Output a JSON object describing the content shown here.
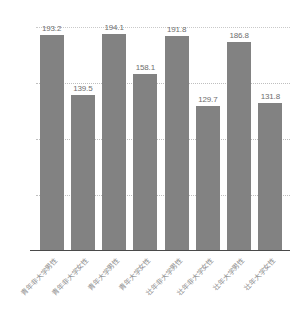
{
  "chart_data": {
    "type": "bar",
    "title": "",
    "xlabel": "",
    "ylabel": "",
    "ylim": [
      0,
      200
    ],
    "yticks": [
      "0.0",
      "50.0",
      "100.0",
      "150.0",
      "200.0"
    ],
    "ytick_values": [
      0,
      50,
      100,
      150,
      200
    ],
    "grid": true,
    "legend": "none",
    "bar_color": "#828282",
    "categories": [
      "青年非大学男性",
      "青年非大学女性",
      "青年大学男性",
      "青年大学女性",
      "壮年非大学男性",
      "壮年非大学女性",
      "壮年大学男性",
      "壮年大学女性"
    ],
    "values": [
      193.2,
      139.5,
      194.1,
      158.1,
      191.8,
      129.7,
      186.8,
      131.8
    ],
    "value_labels": [
      "193.2",
      "139.5",
      "194.1",
      "158.1",
      "191.8",
      "129.7",
      "186.8",
      "131.8"
    ]
  }
}
